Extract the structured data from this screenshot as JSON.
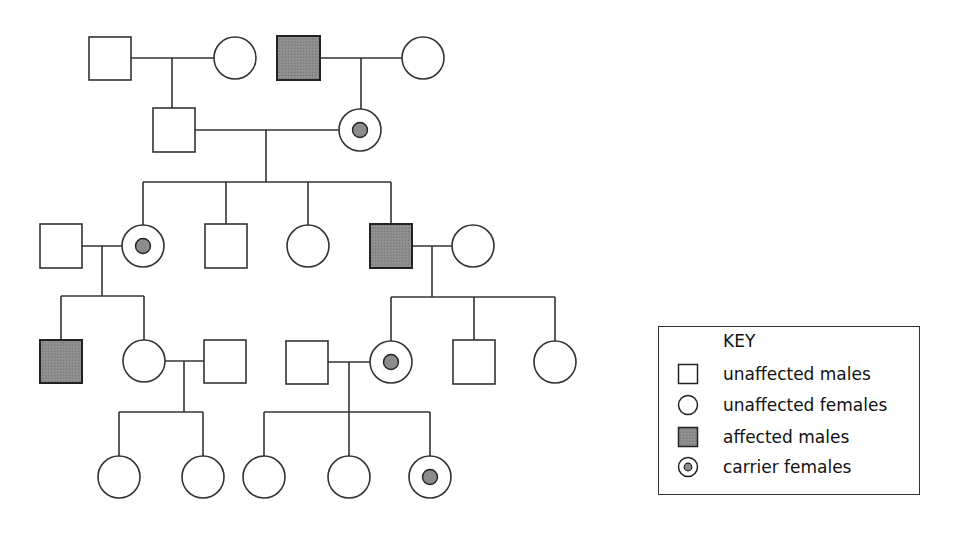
{
  "colors": {
    "line": "#333333",
    "affected_fill": "#8c8c8c",
    "carrier_dot": "#8c8c8c",
    "background": "#ffffff"
  },
  "key": {
    "title": "KEY",
    "items": [
      {
        "symbol": "square-empty",
        "label": "unaffected males"
      },
      {
        "symbol": "circle-empty",
        "label": "unaffected females"
      },
      {
        "symbol": "square-filled",
        "label": "affected males"
      },
      {
        "symbol": "circle-dot",
        "label": "carrier females"
      }
    ]
  },
  "pedigree": {
    "generations": [
      {
        "id": "I",
        "individuals": [
          {
            "id": "I-1",
            "sex": "male",
            "status": "unaffected"
          },
          {
            "id": "I-2",
            "sex": "female",
            "status": "unaffected"
          },
          {
            "id": "I-3",
            "sex": "male",
            "status": "affected"
          },
          {
            "id": "I-4",
            "sex": "female",
            "status": "unaffected"
          }
        ]
      },
      {
        "id": "II",
        "individuals": [
          {
            "id": "II-1",
            "sex": "male",
            "status": "unaffected",
            "parents": [
              "I-1",
              "I-2"
            ]
          },
          {
            "id": "II-2",
            "sex": "female",
            "status": "carrier",
            "parents": [
              "I-3",
              "I-4"
            ]
          }
        ]
      },
      {
        "id": "III",
        "individuals": [
          {
            "id": "III-1",
            "sex": "male",
            "status": "unaffected"
          },
          {
            "id": "III-2",
            "sex": "female",
            "status": "carrier",
            "parents": [
              "II-1",
              "II-2"
            ]
          },
          {
            "id": "III-3",
            "sex": "male",
            "status": "unaffected",
            "parents": [
              "II-1",
              "II-2"
            ]
          },
          {
            "id": "III-4",
            "sex": "female",
            "status": "unaffected",
            "parents": [
              "II-1",
              "II-2"
            ]
          },
          {
            "id": "III-5",
            "sex": "male",
            "status": "affected",
            "parents": [
              "II-1",
              "II-2"
            ]
          },
          {
            "id": "III-6",
            "sex": "female",
            "status": "unaffected"
          }
        ]
      },
      {
        "id": "IV",
        "individuals": [
          {
            "id": "IV-1",
            "sex": "male",
            "status": "affected",
            "parents": [
              "III-1",
              "III-2"
            ]
          },
          {
            "id": "IV-2",
            "sex": "female",
            "status": "unaffected",
            "parents": [
              "III-1",
              "III-2"
            ]
          },
          {
            "id": "IV-3",
            "sex": "male",
            "status": "unaffected"
          },
          {
            "id": "IV-4",
            "sex": "male",
            "status": "unaffected"
          },
          {
            "id": "IV-5",
            "sex": "female",
            "status": "carrier",
            "parents": [
              "III-5",
              "III-6"
            ]
          },
          {
            "id": "IV-6",
            "sex": "male",
            "status": "unaffected",
            "parents": [
              "III-5",
              "III-6"
            ]
          },
          {
            "id": "IV-7",
            "sex": "female",
            "status": "unaffected",
            "parents": [
              "III-5",
              "III-6"
            ]
          }
        ]
      },
      {
        "id": "V",
        "individuals": [
          {
            "id": "V-1",
            "sex": "female",
            "status": "unaffected",
            "parents": [
              "IV-2",
              "IV-3"
            ]
          },
          {
            "id": "V-2",
            "sex": "female",
            "status": "unaffected",
            "parents": [
              "IV-2",
              "IV-3"
            ]
          },
          {
            "id": "V-3",
            "sex": "female",
            "status": "unaffected",
            "parents": [
              "IV-4",
              "IV-5"
            ]
          },
          {
            "id": "V-4",
            "sex": "female",
            "status": "unaffected",
            "parents": [
              "IV-4",
              "IV-5"
            ]
          },
          {
            "id": "V-5",
            "sex": "female",
            "status": "carrier",
            "parents": [
              "IV-4",
              "IV-5"
            ]
          }
        ]
      }
    ]
  }
}
